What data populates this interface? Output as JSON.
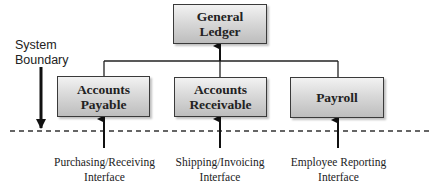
{
  "diagram": {
    "top_box": {
      "line1": "General",
      "line2": "Ledger"
    },
    "modules": [
      {
        "line1": "Accounts",
        "line2": "Payable"
      },
      {
        "line1": "Accounts",
        "line2": "Receivable"
      },
      {
        "line1": "Payroll",
        "line2": ""
      }
    ],
    "boundary_label": {
      "line1": "System",
      "line2": "Boundary"
    },
    "interfaces": [
      {
        "line1": "Purchasing/Receiving",
        "line2": "Interface"
      },
      {
        "line1": "Shipping/Invoicing",
        "line2": "Interface"
      },
      {
        "line1": "Employee Reporting",
        "line2": "Interface"
      }
    ],
    "colors": {
      "line": "#222222",
      "box_top": "#f2f2f2",
      "box_bottom": "#bdbdbd"
    }
  }
}
